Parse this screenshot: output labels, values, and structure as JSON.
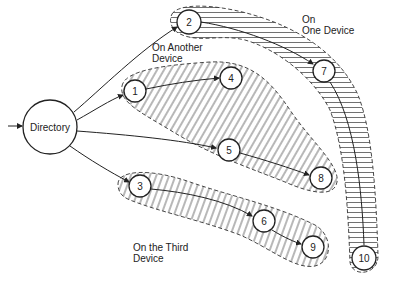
{
  "diagram": {
    "type": "file-directory-distribution",
    "directory": {
      "label": "Directory",
      "cx": 50,
      "cy": 127,
      "r": 27
    },
    "nodes": [
      {
        "id": "1",
        "label": "1",
        "cx": 135,
        "cy": 91
      },
      {
        "id": "2",
        "label": "2",
        "cx": 189,
        "cy": 22
      },
      {
        "id": "3",
        "label": "3",
        "cx": 140,
        "cy": 186
      },
      {
        "id": "4",
        "label": "4",
        "cx": 231,
        "cy": 78
      },
      {
        "id": "5",
        "label": "5",
        "cx": 229,
        "cy": 150
      },
      {
        "id": "6",
        "label": "6",
        "cx": 264,
        "cy": 221
      },
      {
        "id": "7",
        "label": "7",
        "cx": 324,
        "cy": 71
      },
      {
        "id": "8",
        "label": "8",
        "cx": 321,
        "cy": 178
      },
      {
        "id": "9",
        "label": "9",
        "cx": 313,
        "cy": 247
      },
      {
        "id": "10",
        "label": "10",
        "cx": 364,
        "cy": 258
      }
    ],
    "edges": [
      [
        "Directory",
        "1"
      ],
      [
        "Directory",
        "2"
      ],
      [
        "Directory",
        "3"
      ],
      [
        "Directory",
        "5"
      ],
      [
        "1",
        "4"
      ],
      [
        "5",
        "8"
      ],
      [
        "2",
        "7"
      ],
      [
        "7",
        "10"
      ],
      [
        "3",
        "6"
      ],
      [
        "6",
        "9"
      ]
    ],
    "regions": [
      {
        "name": "one-device",
        "label": "On\nOne Device",
        "hatch": "horizontal",
        "members": [
          "2",
          "7",
          "10"
        ]
      },
      {
        "name": "another-device",
        "label": "On Another\nDevice",
        "hatch": "diagonal",
        "members": [
          "1",
          "4",
          "5",
          "8"
        ]
      },
      {
        "name": "third-device",
        "label": "On the Third\nDevice",
        "hatch": "diagonal",
        "members": [
          "3",
          "6",
          "9"
        ]
      }
    ]
  },
  "labels": {
    "one_device": "On\nOne Device",
    "another_device": "On Another\nDevice",
    "third_device": "On the Third\nDevice",
    "directory": "Directory",
    "n1": "1",
    "n2": "2",
    "n3": "3",
    "n4": "4",
    "n5": "5",
    "n6": "6",
    "n7": "7",
    "n8": "8",
    "n9": "9",
    "n10": "10"
  }
}
